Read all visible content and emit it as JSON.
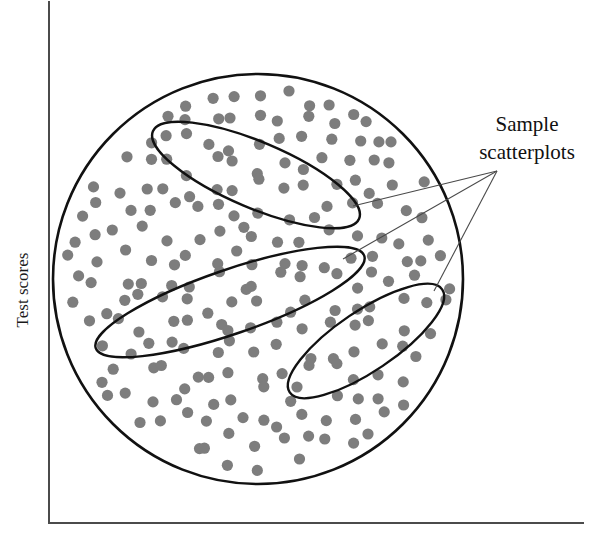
{
  "figure": {
    "type": "conceptual-diagram",
    "background_color": "#ffffff",
    "axes": {
      "y_label": "Test scores",
      "x_label": "",
      "line_color": "#4b4b4b",
      "y_axis": {
        "x": 49,
        "y_top": 2,
        "y_bottom": 523
      },
      "x_axis": {
        "y": 523,
        "x_left": 49,
        "x_right": 583
      }
    },
    "population": {
      "name": "population-circle",
      "center_x": 258,
      "center_y": 279,
      "radius": 205,
      "stroke_color": "#111111",
      "fill_color": "#ffffff"
    },
    "dots": {
      "name": "data-dot",
      "color": "#7d7d7d",
      "radius": 5.6,
      "count": 224,
      "spacing": 23
    },
    "samples": [
      {
        "name": "sample-ellipse-top",
        "cx": 256,
        "cy": 175,
        "rx": 112,
        "ry": 33,
        "rotation_deg": 23
      },
      {
        "name": "sample-ellipse-middle",
        "cx": 230,
        "cy": 302,
        "rx": 142,
        "ry": 32,
        "rotation_deg": -19
      },
      {
        "name": "sample-ellipse-bottom",
        "cx": 366,
        "cy": 341,
        "rx": 92,
        "ry": 30,
        "rotation_deg": -34
      }
    ],
    "callout": {
      "name": "sample-scatterplots-callout",
      "line_1": "Sample",
      "line_2": "scatterplots",
      "anchor_x": 497,
      "anchor_y": 171,
      "leader_targets": [
        {
          "x": 353,
          "y": 206
        },
        {
          "x": 343,
          "y": 259
        },
        {
          "x": 434,
          "y": 291
        }
      ],
      "leader_color": "#4a4a4a"
    }
  },
  "chart_data": {
    "type": "scatter",
    "title": "",
    "xlabel": "",
    "ylabel": "Test scores",
    "grid": false,
    "legend": "none",
    "annotations": [
      "Sample",
      "scatterplots"
    ],
    "groups": [
      {
        "name": "population",
        "shape": "circle",
        "point_count": 224
      },
      {
        "name": "sample-scatterplot-1",
        "shape": "ellipse",
        "tilt_deg": 23
      },
      {
        "name": "sample-scatterplot-2",
        "shape": "ellipse",
        "tilt_deg": -19
      },
      {
        "name": "sample-scatterplot-3",
        "shape": "ellipse",
        "tilt_deg": -34
      }
    ]
  }
}
